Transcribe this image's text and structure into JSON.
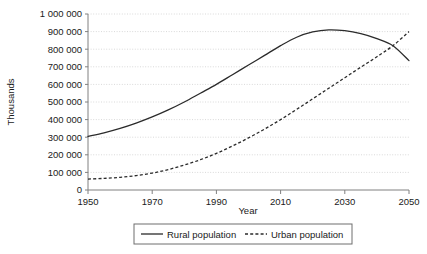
{
  "chart_data": {
    "type": "line",
    "title": "",
    "xlabel": "Year",
    "ylabel": "Thousands",
    "xlim": [
      1950,
      2050
    ],
    "ylim": [
      0,
      1000000
    ],
    "xticks": [
      1950,
      1970,
      1990,
      2010,
      2030,
      2050
    ],
    "xtick_labels": [
      "1950",
      "1970",
      "1990",
      "2010",
      "2030",
      "2050"
    ],
    "yticks": [
      0,
      100000,
      200000,
      300000,
      400000,
      500000,
      600000,
      700000,
      800000,
      900000,
      1000000
    ],
    "ytick_labels": [
      "0",
      "100 000",
      "200 000",
      "300 000",
      "400 000",
      "500 000",
      "600 000",
      "700 000",
      "800 000",
      "900 000",
      "1 000 000"
    ],
    "grid": "horizontal-dotted",
    "legend_position": "bottom-center",
    "x": [
      1950,
      1955,
      1960,
      1965,
      1970,
      1975,
      1980,
      1985,
      1990,
      1995,
      2000,
      2005,
      2010,
      2015,
      2020,
      2025,
      2030,
      2035,
      2040,
      2045,
      2050
    ],
    "series": [
      {
        "name": "Rural population",
        "style": "solid",
        "color": "#2b2b2b",
        "values": [
          305000,
          325000,
          350000,
          380000,
          415000,
          455000,
          500000,
          550000,
          600000,
          655000,
          710000,
          765000,
          820000,
          868000,
          898000,
          910000,
          905000,
          888000,
          860000,
          820000,
          735000
        ]
      },
      {
        "name": "Urban population",
        "style": "dashed",
        "color": "#2b2b2b",
        "values": [
          62000,
          66000,
          72000,
          82000,
          96000,
          116000,
          142000,
          172000,
          208000,
          250000,
          296000,
          346000,
          400000,
          458000,
          518000,
          578000,
          638000,
          698000,
          757000,
          820000,
          900000
        ]
      }
    ],
    "annotations": []
  },
  "legend": {
    "items": [
      {
        "label": "Rural population",
        "style": "solid"
      },
      {
        "label": "Urban population",
        "style": "dashed"
      }
    ]
  },
  "axes": {
    "x_title": "Year",
    "y_title": "Thousands"
  },
  "colors": {
    "line": "#2b2b2b",
    "axis": "#808080",
    "grid": "#d9d9d9",
    "text": "#1a1a1a",
    "legend_border": "#6e6e6e",
    "background": "#ffffff"
  }
}
